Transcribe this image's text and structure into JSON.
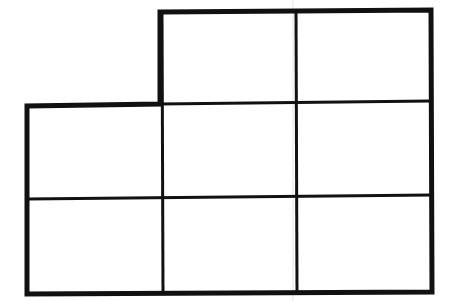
{
  "figure": {
    "type": "polyomino-grid",
    "width": 450,
    "height": 301,
    "background": "#ffffff",
    "stroke_color": "#111111",
    "outline_width": 5,
    "inner_line_width": 3,
    "scan_line_color": "#e4e4e4",
    "rows": 3,
    "cols": 3,
    "cells_present": [
      [
        false,
        true,
        true
      ],
      [
        true,
        true,
        true
      ],
      [
        true,
        true,
        true
      ]
    ],
    "outline_points": "160,12 431,10 432,292 27,294 27,106 160,104",
    "inner_lines": [
      {
        "name": "vertical-line-1",
        "x1": 162,
        "y1": 12,
        "x2": 163,
        "y2": 293
      },
      {
        "name": "vertical-line-2",
        "x1": 296,
        "y1": 11,
        "x2": 297,
        "y2": 293
      },
      {
        "name": "horizontal-line-1",
        "x1": 160,
        "y1": 104,
        "x2": 431,
        "y2": 101
      },
      {
        "name": "horizontal-line-2",
        "x1": 27,
        "y1": 199,
        "x2": 432,
        "y2": 195
      }
    ],
    "scan_line": {
      "x1": 293,
      "y1": 0,
      "x2": 293,
      "y2": 301
    }
  }
}
